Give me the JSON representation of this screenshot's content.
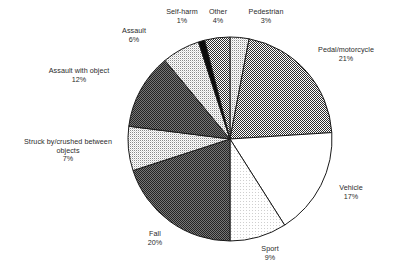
{
  "chart_data": {
    "type": "pie",
    "title": "",
    "subtitle": "",
    "xlabel": "",
    "ylabel": "",
    "legend_position": "labels-around-pie",
    "grid": false,
    "units": "percent",
    "start_angle_deg": 0,
    "direction": "clockwise",
    "categories": [
      "Pedestrian",
      "Pedal/motorcycle",
      "Vehicle",
      "Sport",
      "Fall",
      "Struck by/crushed between objects",
      "Assault with object",
      "Assault",
      "Self-harm",
      "Other"
    ],
    "values": [
      3,
      21,
      17,
      9,
      20,
      7,
      12,
      6,
      1,
      4
    ],
    "slices": [
      {
        "label": "Pedestrian",
        "label_lines": [
          "Pedestrian"
        ],
        "value": 3,
        "percent_text": "3%",
        "fill": "#b9b9b9",
        "pattern": "light-dither"
      },
      {
        "label": "Pedal/motorcycle",
        "label_lines": [
          "Pedal/motorcycle"
        ],
        "value": 21,
        "percent_text": "21%",
        "fill": "#7d7d7d",
        "pattern": "medium-dither"
      },
      {
        "label": "Vehicle",
        "label_lines": [
          "Vehicle"
        ],
        "value": 17,
        "percent_text": "17%",
        "fill": "#ffffff",
        "pattern": "white"
      },
      {
        "label": "Sport",
        "label_lines": [
          "Sport"
        ],
        "value": 9,
        "percent_text": "9%",
        "fill": "#f2f2f2",
        "pattern": "very-light-dither"
      },
      {
        "label": "Fall",
        "label_lines": [
          "Fall"
        ],
        "value": 20,
        "percent_text": "20%",
        "fill": "#474747",
        "pattern": "dark-dither"
      },
      {
        "label": "Struck by/crushed between objects",
        "label_lines": [
          "Struck by/crushed between",
          "objects"
        ],
        "value": 7,
        "percent_text": "7%",
        "fill": "#b9b9b9",
        "pattern": "light-dither"
      },
      {
        "label": "Assault with object",
        "label_lines": [
          "Assault with object"
        ],
        "value": 12,
        "percent_text": "12%",
        "fill": "#4f4f4f",
        "pattern": "dark-dither"
      },
      {
        "label": "Assault",
        "label_lines": [
          "Assault"
        ],
        "value": 6,
        "percent_text": "6%",
        "fill": "#d9d9d9",
        "pattern": "light-dither"
      },
      {
        "label": "Self-harm",
        "label_lines": [
          "Self-harm"
        ],
        "value": 1,
        "percent_text": "1%",
        "fill": "#0d0d0d",
        "pattern": "solid-black"
      },
      {
        "label": "Other",
        "label_lines": [
          "Other"
        ],
        "value": 4,
        "percent_text": "4%",
        "fill": "#6e6e6e",
        "pattern": "medium-dither"
      }
    ],
    "geometry": {
      "center_x": 230,
      "center_y": 139,
      "radius": 102
    },
    "colors": {
      "outline": "#1a1a1a",
      "label_text": "#2b2b2b",
      "background": "#ffffff"
    }
  }
}
